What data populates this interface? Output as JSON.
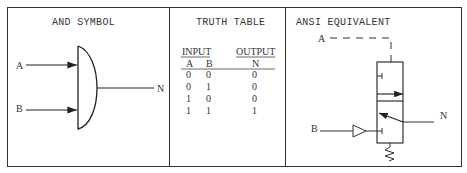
{
  "panels": {
    "and_symbol": {
      "title": "AND SYMBOL",
      "input_a": "A",
      "input_b": "B",
      "output": "N"
    },
    "truth_table": {
      "title": "TRUTH TABLE",
      "group_headers": [
        "INPUT",
        "OUTPUT"
      ],
      "columns": [
        "A",
        "B",
        "N"
      ],
      "rows": [
        [
          "0",
          "0",
          "0"
        ],
        [
          "0",
          "1",
          "0"
        ],
        [
          "1",
          "0",
          "0"
        ],
        [
          "1",
          "1",
          "1"
        ]
      ]
    },
    "ansi_equivalent": {
      "title": "ANSI EQUIVALENT",
      "pilot_a": "A",
      "pilot_b": "B",
      "output": "N"
    }
  }
}
